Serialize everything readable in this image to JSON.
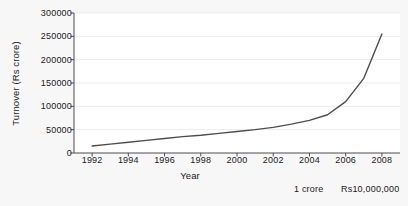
{
  "chart_data": {
    "type": "line",
    "title": "",
    "xlabel": "Year",
    "ylabel": "Turnover (Rs crore)",
    "xlim": [
      1991,
      2009
    ],
    "ylim": [
      0,
      300000
    ],
    "xticks": [
      1992,
      1994,
      1996,
      1998,
      2000,
      2002,
      2004,
      2006,
      2008
    ],
    "xtick_labels": [
      "1992",
      "1994",
      "1996",
      "1998",
      "2000",
      "2002",
      "2004",
      "2006",
      "2008"
    ],
    "yticks": [
      0,
      50000,
      100000,
      150000,
      200000,
      250000,
      300000
    ],
    "ytick_labels": [
      "0",
      "50000",
      "100000",
      "150000",
      "200000",
      "250000",
      "300000"
    ],
    "grid": true,
    "legend": null,
    "series": [
      {
        "name": "Turnover",
        "color": "#4d4d4d",
        "x": [
          1992,
          1993,
          1994,
          1995,
          1996,
          1997,
          1998,
          1999,
          2000,
          2001,
          2002,
          2003,
          2004,
          2005,
          2006,
          2007,
          2008
        ],
        "values": [
          15000,
          19000,
          23000,
          27000,
          31000,
          35000,
          38000,
          42000,
          46000,
          50000,
          55000,
          62000,
          70000,
          82000,
          110000,
          160000,
          255000
        ]
      }
    ],
    "annotations": [
      {
        "text": "1 crore",
        "name": "crore-note"
      },
      {
        "text": "Rs10,000,000",
        "name": "crore-value-note"
      }
    ],
    "colors": {
      "line": "#4d4d4d",
      "axis": "#4d4d4d",
      "grid": "#ededed",
      "plot_background": "#ffffff",
      "figure_background": "#f7f7f7",
      "text": "#1a1a1a"
    }
  }
}
